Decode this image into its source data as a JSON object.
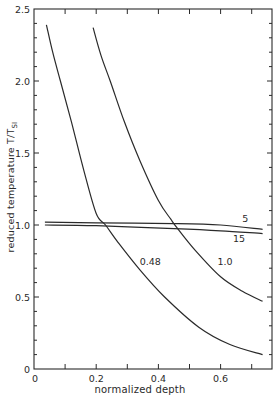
{
  "chart_data": {
    "type": "line",
    "title": "",
    "xlabel": "normalized depth",
    "ylabel": "reduced temperature T/T_SI",
    "ylabel_main": "reduced temperature  T/T",
    "ylabel_sub": "SI",
    "xlim": [
      0,
      0.75
    ],
    "ylim": [
      0,
      2.5
    ],
    "grid": false,
    "legend": "none (curves labeled inline)",
    "x_ticks": [
      0,
      0.2,
      0.4,
      0.6
    ],
    "x_tick_labels": [
      "0",
      "0.2",
      "0.4",
      "0.6"
    ],
    "x_minor_ticks": [
      0.1,
      0.3,
      0.5,
      0.7
    ],
    "y_ticks": [
      0,
      0.5,
      1.0,
      1.5,
      2.0,
      2.5
    ],
    "y_tick_labels": [
      "0",
      "0.5",
      "1.0",
      "1.5",
      "2.0",
      "2.5"
    ],
    "y_minor_step": 0.1,
    "series": [
      {
        "name": "0.48",
        "label": "0.48",
        "x": [
          0.04,
          0.06,
          0.085,
          0.12,
          0.16,
          0.2,
          0.23,
          0.27,
          0.34,
          0.42,
          0.53,
          0.63,
          0.735
        ],
        "y": [
          2.39,
          2.2,
          2.0,
          1.72,
          1.38,
          1.08,
          1.0,
          0.88,
          0.69,
          0.5,
          0.29,
          0.17,
          0.1
        ]
      },
      {
        "name": "1.0",
        "label": "1.0",
        "x": [
          0.19,
          0.215,
          0.245,
          0.29,
          0.34,
          0.4,
          0.44,
          0.46,
          0.52,
          0.6,
          0.67,
          0.735
        ],
        "y": [
          2.37,
          2.18,
          2.0,
          1.72,
          1.45,
          1.17,
          1.04,
          0.98,
          0.82,
          0.64,
          0.54,
          0.47
        ]
      },
      {
        "name": "5",
        "label": "5",
        "x": [
          0.035,
          0.2,
          0.45,
          0.6,
          0.735
        ],
        "y": [
          1.02,
          1.015,
          1.01,
          1.0,
          0.97
        ]
      },
      {
        "name": "15",
        "label": "15",
        "x": [
          0.035,
          0.2,
          0.45,
          0.6,
          0.735
        ],
        "y": [
          1.0,
          0.995,
          0.975,
          0.96,
          0.94
        ]
      }
    ],
    "annotations": [
      {
        "text": "0.48",
        "x": 0.34,
        "y": 0.72
      },
      {
        "text": "1.0",
        "x": 0.59,
        "y": 0.72
      },
      {
        "text": "5",
        "x": 0.67,
        "y": 1.02
      },
      {
        "text": "15",
        "x": 0.64,
        "y": 0.88
      }
    ]
  }
}
